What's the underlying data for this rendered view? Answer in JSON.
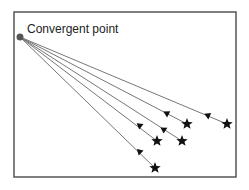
{
  "diagram": {
    "label": "Convergent point",
    "frame": {
      "x": 14,
      "y": 12,
      "width": 222,
      "height": 165,
      "color": "#555555"
    },
    "convergent_point": {
      "x": 20,
      "y": 37,
      "color": "#555555"
    },
    "line_color": "#777777",
    "marker_color": "#111111",
    "rays": [
      {
        "star": {
          "x": 227,
          "y": 124
        },
        "arrow": {
          "x": 207,
          "y": 115
        }
      },
      {
        "star": {
          "x": 187,
          "y": 124
        },
        "arrow": {
          "x": 166,
          "y": 113
        }
      },
      {
        "star": {
          "x": 182,
          "y": 141
        },
        "arrow": {
          "x": 163,
          "y": 129
        }
      },
      {
        "star": {
          "x": 157,
          "y": 141
        },
        "arrow": {
          "x": 139,
          "y": 125
        }
      },
      {
        "star": {
          "x": 155,
          "y": 168
        },
        "arrow": {
          "x": 139,
          "y": 151
        }
      }
    ]
  }
}
